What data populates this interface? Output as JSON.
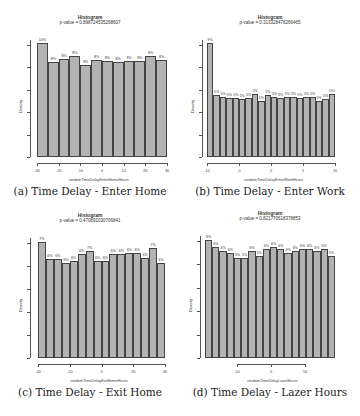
{
  "chart_data": [
    {
      "type": "bar",
      "title": "Histogram",
      "subtitle": "p-value = 0.898724535268607",
      "caption": "(a) Time Delay - Enter Home",
      "xlabel": "randomTimeDelayEnterHomeHours",
      "ylabel": "Density",
      "xlim": [
        -30,
        30
      ],
      "xticks": [
        "-30",
        "-20",
        "-10",
        "0",
        "10",
        "20",
        "30"
      ],
      "labels": [
        "10%",
        "8%",
        "8%",
        "8%",
        "8%",
        "8%",
        "8%",
        "8%",
        "8%",
        "8%",
        "8%",
        "8%"
      ],
      "values": [
        9.7,
        8.1,
        8.4,
        8.6,
        7.9,
        8.3,
        8.2,
        8.1,
        8.2,
        8.2,
        8.6,
        8.3
      ],
      "grid": false
    },
    {
      "type": "bar",
      "title": "Histogram",
      "subtitle": "p-value = 0.313328478266465",
      "caption": "(b) Time Delay - Enter Work",
      "xlabel": "randomTimeDelayEnterWorkHours",
      "ylabel": "Density",
      "xlim": [
        -10,
        10
      ],
      "xticks": [
        "-10",
        "-5",
        "0",
        "5",
        "10"
      ],
      "labels": [
        "9%",
        "5%",
        "5%",
        "5%",
        "5%",
        "5%",
        "5%",
        "5%",
        "5%",
        "5%",
        "5%",
        "5%",
        "5%",
        "5%",
        "5%",
        "5%",
        "5%",
        "5%",
        "5%",
        "5%"
      ],
      "values": [
        9.4,
        5.1,
        5.0,
        4.9,
        4.9,
        4.8,
        4.9,
        5.2,
        4.6,
        5.1,
        5.0,
        4.9,
        5.0,
        5.0,
        4.9,
        5.0,
        5.0,
        4.6,
        4.8,
        5.2
      ],
      "grid": false
    },
    {
      "type": "bar",
      "title": "Histogram",
      "subtitle": "p-value = 0.470891030706841",
      "caption": "(c) Time Delay - Exit Home",
      "xlabel": "randomTimeDelayExitHomeHours",
      "ylabel": "Density",
      "xlim": [
        -40,
        40
      ],
      "xticks": [
        "-40",
        "-20",
        "0",
        "20",
        "40"
      ],
      "labels": [
        "7%",
        "6%",
        "6%",
        "6%",
        "6%",
        "6%",
        "7%",
        "6%",
        "6%",
        "6%",
        "6%",
        "6%",
        "6%",
        "6%",
        "7%",
        "6%"
      ],
      "values": [
        7.2,
        6.1,
        6.1,
        5.9,
        6.0,
        6.4,
        6.6,
        6.0,
        6.0,
        6.4,
        6.4,
        6.5,
        6.5,
        6.2,
        6.8,
        5.9
      ],
      "grid": false
    },
    {
      "type": "bar",
      "title": "Histogram",
      "subtitle": "p-value = 0.821770618378853",
      "caption": "(d) Time Delay - Lazer Hours",
      "xlabel": "randomTimeDelayLazerHours",
      "ylabel": "Density",
      "xlim": [
        -90,
        90
      ],
      "xticks": [
        "-50",
        "0",
        "50"
      ],
      "labels": [
        "6%",
        "6%",
        "6%",
        "6%",
        "5%",
        "5%",
        "6%",
        "5%",
        "6%",
        "6%",
        "6%",
        "6%",
        "6%",
        "6%",
        "6%",
        "6%",
        "6%",
        "5%"
      ],
      "values": [
        6.4,
        6.0,
        5.8,
        5.7,
        5.4,
        5.4,
        5.8,
        5.5,
        5.9,
        6.0,
        5.9,
        5.7,
        5.8,
        5.9,
        5.9,
        5.8,
        5.9,
        5.5
      ],
      "grid": false
    }
  ]
}
